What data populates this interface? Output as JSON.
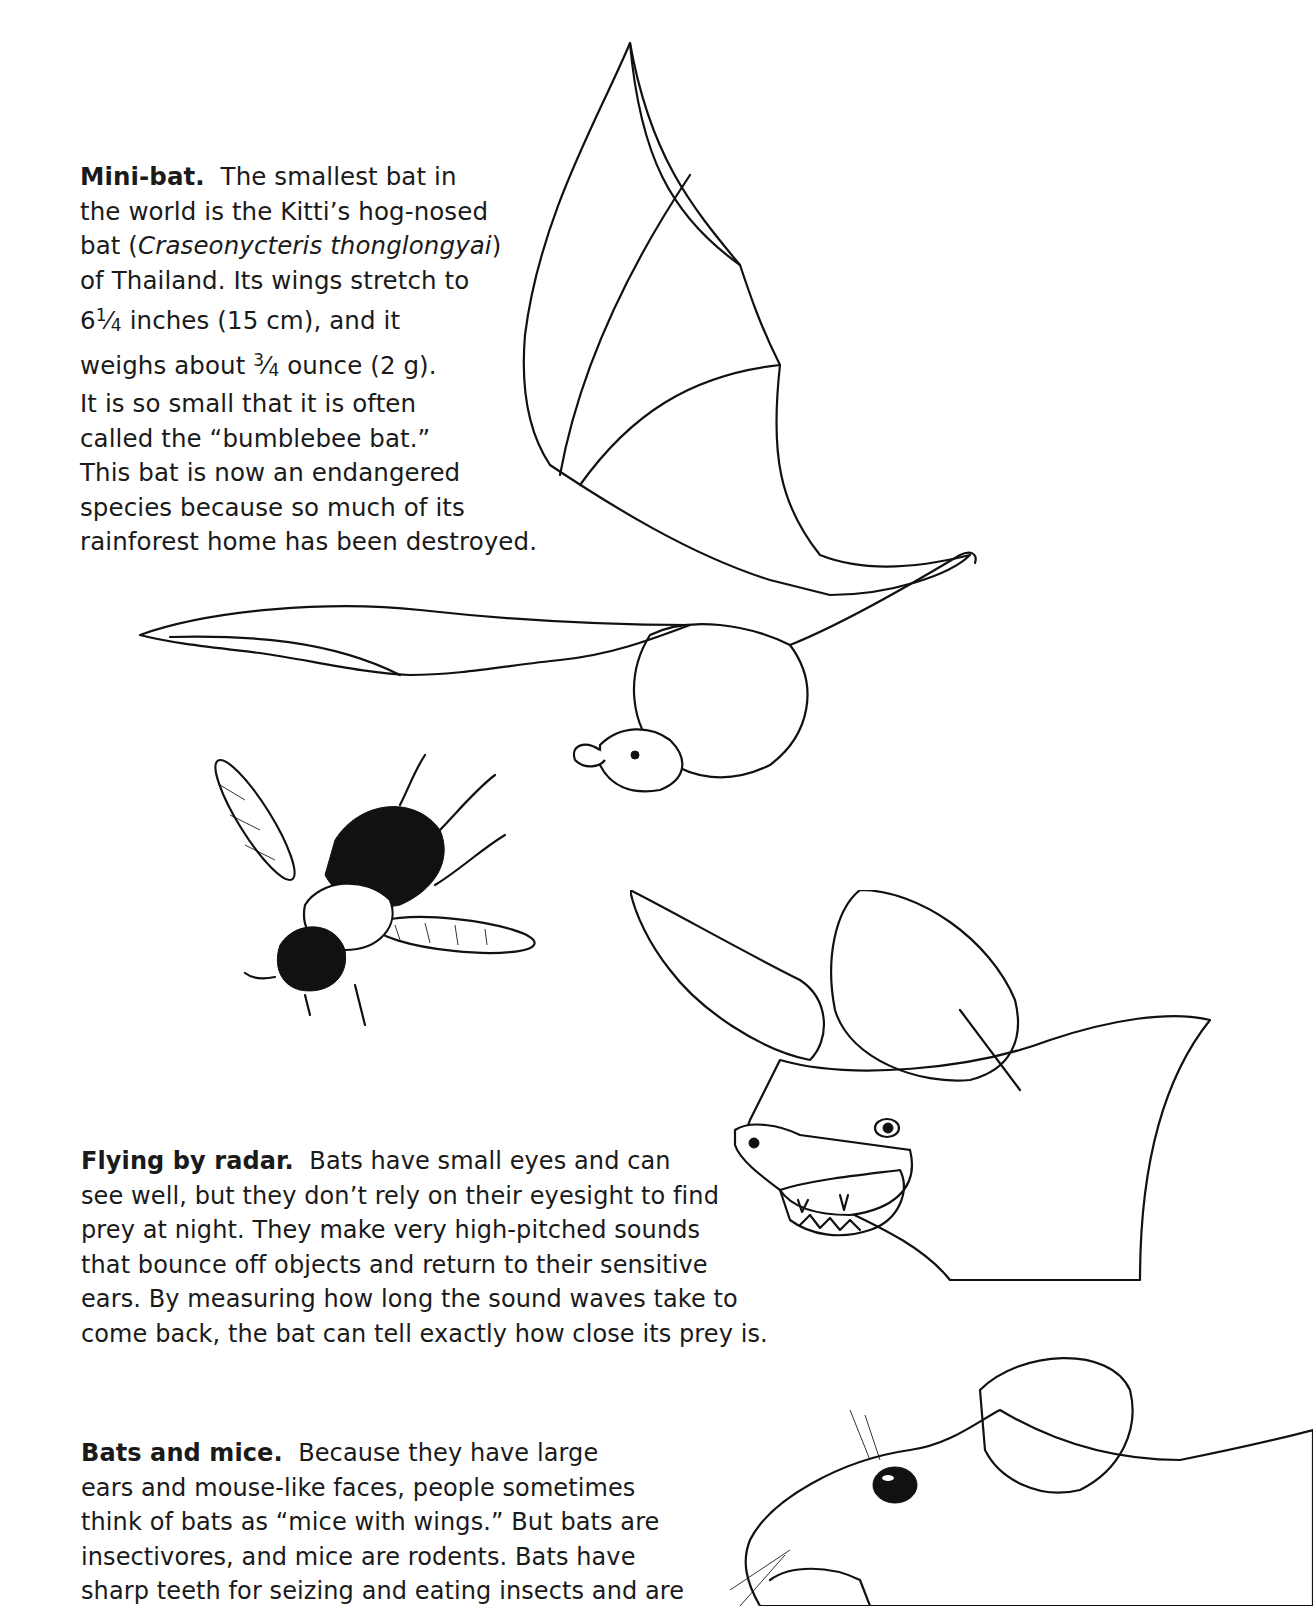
{
  "sections": [
    {
      "id": "mini-bat",
      "heading": "Mini-bat.",
      "lines": [
        {
          "after_heading": "The smallest bat in"
        },
        {
          "text": "the world is the Kitti’s hog-nosed"
        },
        {
          "pre": "bat (",
          "italic": "Craseonycteris thonglongyai",
          "post": ")"
        },
        {
          "text": "of Thailand. Its wings stretch to"
        },
        {
          "whole": "6",
          "num": "1",
          "slash": "⁄",
          "den": "4",
          "rest": " inches (15 cm), and it"
        },
        {
          "pre": "weighs about ",
          "num": "3",
          "slash": "⁄",
          "den": "4",
          "rest": " ounce (2 g)."
        },
        {
          "text": "It is so small that it is often"
        },
        {
          "text": "called the “bumblebee bat.”"
        },
        {
          "text": "This bat is now an endangered"
        },
        {
          "text": "species because so much of its"
        },
        {
          "text": "rainforest home has been destroyed."
        }
      ]
    },
    {
      "id": "flying-by-radar",
      "heading": "Flying by radar.",
      "lines": [
        {
          "after_heading": "Bats have small eyes and can"
        },
        {
          "text": "see well, but they don’t rely on their eyesight to find"
        },
        {
          "text": "prey at night. They make very high-pitched sounds"
        },
        {
          "text": "that bounce off objects and return to their sensitive"
        },
        {
          "text": "ears. By measuring how long the sound waves take to"
        },
        {
          "text": "come back, the bat can tell exactly how close its prey is."
        }
      ]
    },
    {
      "id": "bats-and-mice",
      "heading": "Bats and mice.",
      "lines": [
        {
          "after_heading": "Because they have large"
        },
        {
          "text": "ears and mouse-like faces, people sometimes"
        },
        {
          "text": "think of bats as “mice with wings.” But bats are"
        },
        {
          "text": "insectivores, and mice are rodents. Bats have"
        },
        {
          "text": "sharp teeth for seizing and eating insects and are"
        }
      ]
    }
  ],
  "illustrations": [
    {
      "name": "flying-bat-illustration",
      "subject": "Kitti's hog-nosed bat in flight"
    },
    {
      "name": "bumblebee-illustration",
      "subject": "bumblebee in flight"
    },
    {
      "name": "long-eared-bat-head-illustration",
      "subject": "bat head with large ears, mouth open"
    },
    {
      "name": "mouse-head-illustration",
      "subject": "mouse head"
    }
  ],
  "colors": {
    "ink": "#111111",
    "paper": "#ffffff"
  }
}
